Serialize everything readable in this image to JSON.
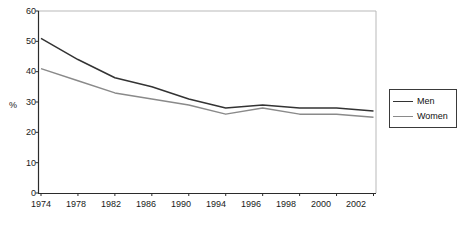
{
  "chart_data": {
    "type": "line",
    "title": "",
    "xlabel": "",
    "ylabel": "%",
    "ylim": [
      0,
      60
    ],
    "ytick_values": [
      0,
      10,
      20,
      30,
      40,
      50,
      60
    ],
    "grid": false,
    "legend_position": "right",
    "categories": [
      "1974",
      "1978",
      "1982",
      "1986",
      "1990",
      "1994",
      "1996",
      "1998",
      "2000",
      "2002"
    ],
    "series": [
      {
        "name": "Men",
        "color": "#333333",
        "values": [
          51,
          44,
          38,
          35,
          31,
          28,
          29,
          28,
          28,
          27
        ]
      },
      {
        "name": "Women",
        "color": "#8a8a8a",
        "values": [
          41,
          37,
          33,
          31,
          29,
          26,
          28,
          26,
          26,
          25
        ]
      }
    ]
  },
  "axis": {
    "y_unit_label": "%",
    "y_ticks": [
      "60",
      "50",
      "40",
      "30",
      "20",
      "10",
      "0"
    ],
    "x_ticks": [
      "1974",
      "1978",
      "1982",
      "1986",
      "1990",
      "1994",
      "1996",
      "1998",
      "2000",
      "2002"
    ]
  },
  "legend": {
    "entries": [
      {
        "label": "Men",
        "color": "#333333"
      },
      {
        "label": "Women",
        "color": "#8a8a8a"
      }
    ]
  },
  "colors": {
    "men": "#333333",
    "women": "#8a8a8a",
    "axis": "#2b2b2b",
    "plot_border_light": "#b9b9b9",
    "background": "#ffffff"
  }
}
